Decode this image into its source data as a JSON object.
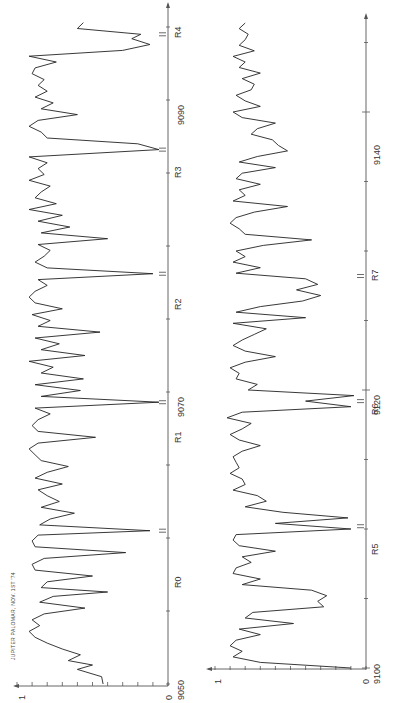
{
  "chart_data": [
    {
      "type": "line",
      "title": "JUPITER PALOMAR, NOV. 1ST '74",
      "panel": "upper",
      "orientation": "rotated-90-ccw",
      "xlabel": "wavenumber",
      "ylabel": "relative intensity",
      "xlim": [
        9050,
        9100
      ],
      "ylim": [
        0,
        1
      ],
      "x_ticks": [
        "9050",
        "9070",
        "9090"
      ],
      "y_ticks": [
        "0",
        "1"
      ],
      "grid": false,
      "annotations": [
        {
          "label": "R0",
          "x": 9060.5
        },
        {
          "label": "R1",
          "x": 9069.3
        },
        {
          "label": "R2",
          "x": 9078.1
        },
        {
          "label": "R3",
          "x": 9086.6
        },
        {
          "label": "R4",
          "x": 9094.5
        }
      ],
      "series": [
        {
          "name": "spectrum",
          "x": [
            9050.0,
            9050.5,
            9051.0,
            9051.3,
            9051.6,
            9052.0,
            9052.4,
            9052.8,
            9053.2,
            9053.6,
            9054.0,
            9054.4,
            9054.8,
            9055.2,
            9055.6,
            9056.0,
            9056.3,
            9056.6,
            9057.0,
            9057.4,
            9057.8,
            9058.2,
            9058.6,
            9059.0,
            9059.4,
            9059.8,
            9060.2,
            9060.5,
            9060.9,
            9061.3,
            9061.7,
            9062.1,
            9062.5,
            9062.9,
            9063.3,
            9063.7,
            9064.1,
            9064.5,
            9064.9,
            9065.3,
            9065.7,
            9066.1,
            9066.5,
            9066.9,
            9067.3,
            9067.7,
            9068.1,
            9068.5,
            9068.9,
            9069.3,
            9069.7,
            9070.1,
            9070.5,
            9070.9,
            9071.3,
            9071.7,
            9072.1,
            9072.5,
            9072.9,
            9073.3,
            9073.7,
            9074.1,
            9074.5,
            9074.9,
            9075.3,
            9075.7,
            9076.1,
            9076.5,
            9076.9,
            9077.3,
            9077.7,
            9078.1,
            9078.5,
            9078.9,
            9079.3,
            9079.7,
            9080.1,
            9080.5,
            9080.9,
            9081.3,
            9081.7,
            9082.1,
            9082.5,
            9082.9,
            9083.3,
            9083.7,
            9084.1,
            9084.5,
            9084.9,
            9085.3,
            9085.7,
            9086.1,
            9086.6,
            9087.0,
            9087.4,
            9087.8,
            9088.2,
            9088.6,
            9089.0,
            9089.4,
            9089.8,
            9090.2,
            9090.6,
            9091.0,
            9091.4,
            9091.8,
            9092.2,
            9092.6,
            9093.0,
            9093.4,
            9093.8,
            9094.2,
            9094.5,
            9094.9,
            9095.3
          ],
          "y": [
            0.43,
            0.44,
            0.6,
            0.5,
            0.66,
            0.58,
            0.7,
            0.8,
            0.88,
            0.92,
            0.85,
            0.9,
            0.82,
            0.55,
            0.85,
            0.76,
            0.4,
            0.84,
            0.8,
            0.5,
            0.88,
            0.9,
            0.82,
            0.28,
            0.88,
            0.9,
            0.86,
            0.12,
            0.85,
            0.78,
            0.62,
            0.84,
            0.72,
            0.8,
            0.86,
            0.7,
            0.88,
            0.8,
            0.66,
            0.84,
            0.88,
            0.92,
            0.86,
            0.48,
            0.86,
            0.9,
            0.86,
            0.78,
            0.88,
            0.06,
            0.84,
            0.58,
            0.88,
            0.56,
            0.84,
            0.76,
            0.92,
            0.55,
            0.84,
            0.72,
            0.88,
            0.45,
            0.86,
            0.78,
            0.9,
            0.7,
            0.88,
            0.92,
            0.88,
            0.8,
            0.86,
            0.1,
            0.8,
            0.88,
            0.82,
            0.78,
            0.86,
            0.4,
            0.84,
            0.65,
            0.86,
            0.7,
            0.92,
            0.74,
            0.88,
            0.84,
            0.78,
            0.92,
            0.82,
            0.86,
            0.8,
            0.92,
            0.06,
            0.2,
            0.8,
            0.84,
            0.92,
            0.86,
            0.6,
            0.84,
            0.76,
            0.88,
            0.8,
            0.86,
            0.82,
            0.9,
            0.88,
            0.74,
            0.92,
            0.3,
            0.12,
            0.24,
            0.18,
            0.6,
            0.56
          ]
        }
      ]
    },
    {
      "type": "line",
      "panel": "lower",
      "orientation": "rotated-90-ccw",
      "xlabel": "wavenumber",
      "ylabel": "relative intensity",
      "xlim": [
        9100,
        9150
      ],
      "ylim": [
        0,
        1
      ],
      "x_ticks": [
        "9100",
        "9120",
        "9140"
      ],
      "y_ticks": [
        "0",
        "1"
      ],
      "grid": false,
      "annotations": [
        {
          "label": "R5",
          "x": 9110.2
        },
        {
          "label": "R6",
          "x": 9119.2
        },
        {
          "label": "R7",
          "x": 9128.2
        }
      ],
      "series": [
        {
          "name": "spectrum",
          "x": [
            9100.0,
            9100.4,
            9100.8,
            9101.2,
            9101.6,
            9102.0,
            9102.4,
            9102.8,
            9103.2,
            9103.6,
            9104.0,
            9104.4,
            9104.8,
            9105.2,
            9105.6,
            9106.0,
            9106.4,
            9106.8,
            9107.2,
            9107.6,
            9108.0,
            9108.4,
            9108.8,
            9109.2,
            9109.6,
            9110.0,
            9110.4,
            9110.8,
            9111.2,
            9111.6,
            9112.0,
            9112.4,
            9112.8,
            9113.2,
            9113.6,
            9114.0,
            9114.4,
            9114.8,
            9115.2,
            9115.6,
            9116.0,
            9116.4,
            9116.8,
            9117.2,
            9117.6,
            9118.0,
            9118.4,
            9118.8,
            9119.2,
            9119.6,
            9120.0,
            9120.4,
            9120.8,
            9121.2,
            9121.6,
            9122.0,
            9122.4,
            9122.8,
            9123.2,
            9123.6,
            9124.0,
            9124.4,
            9124.8,
            9125.2,
            9125.6,
            9126.0,
            9126.4,
            9126.8,
            9127.2,
            9127.6,
            9128.0,
            9128.4,
            9128.8,
            9129.2,
            9129.6,
            9130.0,
            9130.4,
            9130.8,
            9131.2,
            9131.6,
            9132.0,
            9132.4,
            9132.8,
            9133.2,
            9133.6,
            9134.0,
            9134.4,
            9134.8,
            9135.2,
            9135.6,
            9136.0,
            9136.4,
            9136.8,
            9137.2,
            9137.6,
            9138.0,
            9138.4,
            9138.8,
            9139.2,
            9139.6,
            9140.0,
            9140.4,
            9140.8,
            9141.2,
            9141.6,
            9142.0,
            9142.4,
            9142.8,
            9143.2,
            9143.6,
            9144.0,
            9144.4,
            9144.8,
            9145.2,
            9145.6,
            9146.0,
            9146.4
          ],
          "y": [
            0.1,
            0.7,
            0.88,
            0.82,
            0.9,
            0.86,
            0.7,
            0.84,
            0.48,
            0.8,
            0.75,
            0.28,
            0.32,
            0.26,
            0.36,
            0.82,
            0.7,
            0.88,
            0.86,
            0.76,
            0.82,
            0.6,
            0.84,
            0.88,
            0.86,
            0.1,
            0.6,
            0.12,
            0.55,
            0.8,
            0.66,
            0.72,
            0.88,
            0.8,
            0.82,
            0.9,
            0.84,
            0.86,
            0.88,
            0.82,
            0.7,
            0.84,
            0.9,
            0.82,
            0.76,
            0.92,
            0.82,
            0.1,
            0.4,
            0.08,
            0.78,
            0.72,
            0.86,
            0.84,
            0.9,
            0.8,
            0.6,
            0.8,
            0.88,
            0.82,
            0.74,
            0.66,
            0.88,
            0.4,
            0.86,
            0.7,
            0.42,
            0.3,
            0.46,
            0.32,
            0.4,
            0.86,
            0.7,
            0.88,
            0.8,
            0.86,
            0.68,
            0.36,
            0.8,
            0.84,
            0.9,
            0.86,
            0.74,
            0.52,
            0.88,
            0.8,
            0.84,
            0.7,
            0.86,
            0.82,
            0.6,
            0.84,
            0.72,
            0.52,
            0.58,
            0.62,
            0.76,
            0.72,
            0.6,
            0.82,
            0.88,
            0.7,
            0.8,
            0.86,
            0.76,
            0.74,
            0.82,
            0.7,
            0.84,
            0.8,
            0.88,
            0.74,
            0.84,
            0.8,
            0.78,
            0.84,
            0.8
          ]
        }
      ]
    }
  ],
  "figure": {
    "title_label": "JUPITER PALOMAR, NOV. 1ST '74",
    "upper": {
      "tick_9050": "9050",
      "tick_9070": "9070",
      "tick_9090": "9090",
      "y0": "0",
      "y1": "1",
      "r_labels": [
        "R0",
        "R1",
        "R2",
        "R3",
        "R4"
      ]
    },
    "lower": {
      "tick_9100": "9100",
      "tick_9120": "9120",
      "tick_9140": "9140",
      "y0": "0",
      "y1": "1",
      "r_labels": [
        "R5",
        "R6",
        "R7"
      ]
    }
  }
}
